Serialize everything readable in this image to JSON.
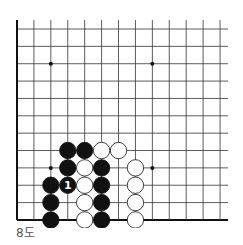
{
  "caption": "8도",
  "board": {
    "cols": 13,
    "rows": 12,
    "origin_x": 17,
    "origin_y": 29,
    "spacing_x": 16.92,
    "spacing_y": 17.36,
    "top_extend": 9,
    "right_extend": 8,
    "line_color": "#333333",
    "edge_color": "#111111",
    "star_points": [
      [
        3,
        3
      ],
      [
        9,
        3
      ],
      [
        3,
        9
      ],
      [
        9,
        9
      ]
    ],
    "stones": [
      {
        "col": 4,
        "row": 8,
        "color": "black"
      },
      {
        "col": 5,
        "row": 8,
        "color": "black"
      },
      {
        "col": 6,
        "row": 8,
        "color": "white"
      },
      {
        "col": 7,
        "row": 8,
        "color": "white"
      },
      {
        "col": 4,
        "row": 9,
        "color": "black"
      },
      {
        "col": 5,
        "row": 9,
        "color": "white"
      },
      {
        "col": 6,
        "row": 9,
        "color": "black"
      },
      {
        "col": 8,
        "row": 9,
        "color": "white"
      },
      {
        "col": 3,
        "row": 10,
        "color": "black"
      },
      {
        "col": 4,
        "row": 10,
        "color": "black",
        "label": "1"
      },
      {
        "col": 5,
        "row": 10,
        "color": "white"
      },
      {
        "col": 6,
        "row": 10,
        "color": "black"
      },
      {
        "col": 8,
        "row": 10,
        "color": "white"
      },
      {
        "col": 3,
        "row": 11,
        "color": "black"
      },
      {
        "col": 5,
        "row": 11,
        "color": "white"
      },
      {
        "col": 6,
        "row": 11,
        "color": "black"
      },
      {
        "col": 8,
        "row": 11,
        "color": "white"
      },
      {
        "col": 3,
        "row": 12,
        "color": "black"
      },
      {
        "col": 5,
        "row": 12,
        "color": "white"
      },
      {
        "col": 6,
        "row": 12,
        "color": "black"
      },
      {
        "col": 8,
        "row": 12,
        "color": "white"
      }
    ]
  }
}
